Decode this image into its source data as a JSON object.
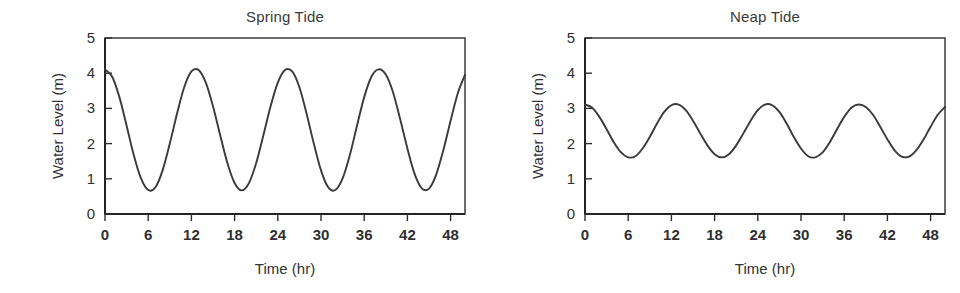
{
  "figure": {
    "background_color": "#ffffff",
    "line_color": "#3a3a3a",
    "axis_color": "#2e2e2e",
    "panel_count": 2
  },
  "chart_data": [
    {
      "type": "line",
      "title": "Spring Tide",
      "xlabel": "Time (hr)",
      "ylabel": "Water Level (m)",
      "xlim": [
        0,
        50
      ],
      "ylim": [
        0,
        5
      ],
      "xticks": [
        0,
        6,
        12,
        18,
        24,
        30,
        36,
        42,
        48
      ],
      "yticks": [
        0,
        1,
        2,
        3,
        4,
        5
      ],
      "xtick_labels": [
        "0",
        "6",
        "12",
        "18",
        "24",
        "30",
        "36",
        "42",
        "48"
      ],
      "ytick_labels": [
        "0",
        "1",
        "2",
        "3",
        "4",
        "5"
      ],
      "grid": false,
      "legend": "none",
      "series": [
        {
          "name": "Spring tide water level",
          "waveform": "sinusoid",
          "mean_level_m": 2.38,
          "amplitude_m": 1.73,
          "period_hr": 12.4,
          "peak_m": 4.11,
          "trough_m": 0.65,
          "phase_peak_hr": 0.0,
          "x": [
            0,
            1,
            2,
            3,
            4,
            5,
            6,
            7,
            8,
            9,
            10,
            11,
            12,
            13,
            14,
            15,
            16,
            17,
            18,
            19,
            20,
            21,
            22,
            23,
            24,
            25,
            26,
            27,
            28,
            29,
            30,
            31,
            32,
            33,
            34,
            35,
            36,
            37,
            38,
            39,
            40,
            41,
            42,
            43,
            44,
            45,
            46,
            47,
            48,
            49,
            50
          ],
          "values": [
            4.11,
            3.9,
            3.32,
            2.51,
            1.67,
            1.01,
            0.68,
            0.76,
            1.24,
            2.0,
            2.85,
            3.6,
            4.05,
            4.09,
            3.73,
            3.06,
            2.24,
            1.45,
            0.88,
            0.67,
            0.88,
            1.45,
            2.24,
            3.06,
            3.73,
            4.09,
            4.05,
            3.6,
            2.85,
            2.0,
            1.24,
            0.76,
            0.68,
            1.01,
            1.67,
            2.51,
            3.32,
            3.9,
            4.11,
            3.96,
            3.46,
            2.69,
            1.86,
            1.14,
            0.73,
            0.72,
            1.12,
            1.82,
            2.65,
            3.43,
            3.95
          ]
        }
      ]
    },
    {
      "type": "line",
      "title": "Neap Tide",
      "xlabel": "Time (hr)",
      "ylabel": "Water Level (m)",
      "xlim": [
        0,
        50
      ],
      "ylim": [
        0,
        5
      ],
      "xticks": [
        0,
        6,
        12,
        18,
        24,
        30,
        36,
        42,
        48
      ],
      "yticks": [
        0,
        1,
        2,
        3,
        4,
        5
      ],
      "xtick_labels": [
        "0",
        "6",
        "12",
        "18",
        "24",
        "30",
        "36",
        "42",
        "48"
      ],
      "ytick_labels": [
        "0",
        "1",
        "2",
        "3",
        "4",
        "5"
      ],
      "grid": false,
      "legend": "none",
      "series": [
        {
          "name": "Neap tide water level",
          "waveform": "sinusoid",
          "mean_level_m": 2.35,
          "amplitude_m": 0.76,
          "period_hr": 12.4,
          "peak_m": 3.11,
          "trough_m": 1.59,
          "phase_peak_hr": 0.0,
          "x": [
            0,
            1,
            2,
            3,
            4,
            5,
            6,
            7,
            8,
            9,
            10,
            11,
            12,
            13,
            14,
            15,
            16,
            17,
            18,
            19,
            20,
            21,
            22,
            23,
            24,
            25,
            26,
            27,
            28,
            29,
            30,
            31,
            32,
            33,
            34,
            35,
            36,
            37,
            38,
            39,
            40,
            41,
            42,
            43,
            44,
            45,
            46,
            47,
            48,
            49,
            50
          ],
          "values": [
            3.11,
            3.02,
            2.76,
            2.41,
            2.04,
            1.75,
            1.61,
            1.64,
            1.86,
            2.19,
            2.57,
            2.9,
            3.09,
            3.11,
            2.95,
            2.65,
            2.29,
            1.95,
            1.7,
            1.61,
            1.7,
            1.95,
            2.29,
            2.65,
            2.95,
            3.11,
            3.09,
            2.9,
            2.57,
            2.19,
            1.86,
            1.64,
            1.61,
            1.75,
            2.04,
            2.41,
            2.76,
            3.02,
            3.11,
            3.04,
            2.82,
            2.48,
            2.12,
            1.81,
            1.63,
            1.63,
            1.81,
            2.11,
            2.48,
            2.82,
            3.04
          ]
        }
      ]
    }
  ]
}
